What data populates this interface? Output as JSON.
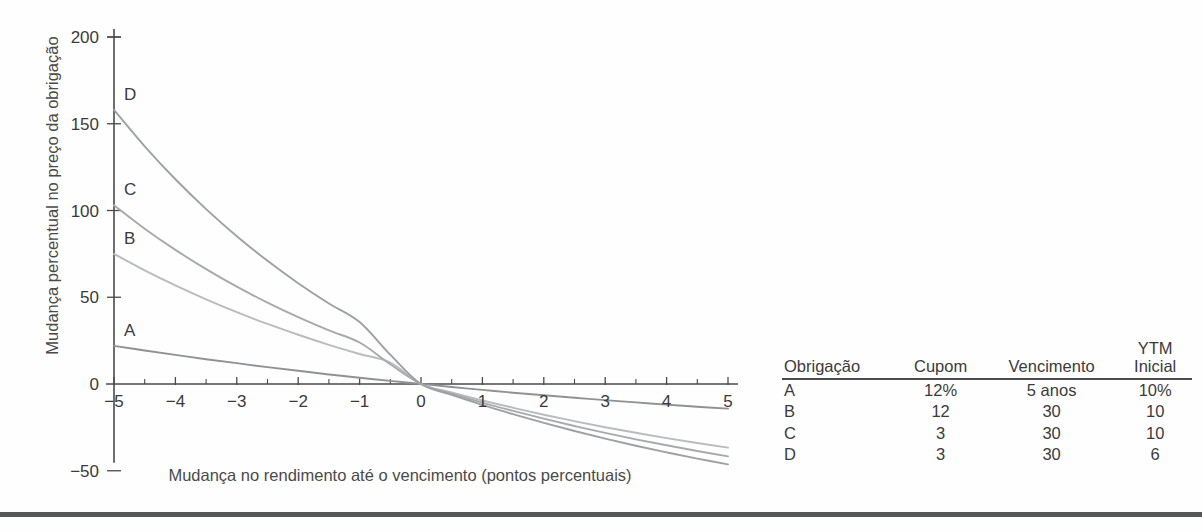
{
  "chart_data": {
    "type": "line",
    "title": "",
    "xlabel": "Mudança no rendimento até o vencimento (pontos percentuais)",
    "ylabel": "Mudança percentual no preço da obrigação",
    "xlim": [
      -5,
      5
    ],
    "ylim": [
      -50,
      200
    ],
    "xticks": [
      -5,
      -4,
      -3,
      -2,
      -1,
      0,
      1,
      2,
      3,
      4,
      5
    ],
    "xtick_labels": [
      "-5",
      "-4",
      "-3",
      "-2",
      "-1",
      "0",
      "1",
      "2",
      "3",
      "4",
      "5"
    ],
    "xtick_minor_step": 0.5,
    "yticks": [
      0,
      50,
      100,
      150,
      200
    ],
    "ytick_labels": [
      "0",
      "50",
      "100",
      "150",
      "200"
    ],
    "grid": false,
    "legend_position": "inline-curve-labels",
    "x": [
      -5,
      -4.5,
      -4,
      -3.5,
      -3,
      -2.5,
      -2,
      -1.5,
      -1,
      -0.5,
      0,
      0.5,
      1,
      1.5,
      2,
      2.5,
      3,
      3.5,
      4,
      4.5,
      5
    ],
    "series": [
      {
        "name": "A",
        "label": "A",
        "color": "#8f9295",
        "values": [
          22.0,
          19.3,
          16.8,
          14.3,
          12.0,
          9.7,
          7.6,
          5.5,
          3.6,
          1.8,
          0.0,
          -1.7,
          -3.4,
          -5.0,
          -6.5,
          -7.9,
          -9.3,
          -10.6,
          -11.9,
          -13.1,
          -14.2
        ]
      },
      {
        "name": "B",
        "label": "B",
        "color": "#b9bcbf",
        "values": [
          75.0,
          65.5,
          56.8,
          48.8,
          41.4,
          34.6,
          28.4,
          22.6,
          17.3,
          12.4,
          0.0,
          -4.9,
          -9.5,
          -13.7,
          -17.7,
          -21.4,
          -24.9,
          -28.1,
          -31.2,
          -34.0,
          -36.7
        ]
      },
      {
        "name": "C",
        "label": "C",
        "color": "#a7aaad",
        "values": [
          103.0,
          89.5,
          77.3,
          66.2,
          56.1,
          46.9,
          38.5,
          30.9,
          23.9,
          11.4,
          0.0,
          -5.5,
          -10.7,
          -15.5,
          -20.0,
          -24.2,
          -28.2,
          -31.9,
          -35.3,
          -38.6,
          -41.7
        ]
      },
      {
        "name": "D",
        "label": "D",
        "color": "#9ea1a4",
        "values": [
          158.0,
          137.0,
          118.0,
          100.8,
          85.2,
          71.0,
          58.1,
          46.4,
          35.7,
          16.9,
          0.0,
          -6.2,
          -12.0,
          -17.4,
          -22.4,
          -27.1,
          -31.5,
          -35.6,
          -39.4,
          -43.0,
          -46.3
        ]
      }
    ]
  },
  "table": {
    "headers": [
      {
        "line1": "Obrigação",
        "line2": ""
      },
      {
        "line1": "Cupom",
        "line2": ""
      },
      {
        "line1": "Vencimento",
        "line2": ""
      },
      {
        "line1": "YTM",
        "line2": "Inicial"
      }
    ],
    "rows": [
      {
        "bond": "A",
        "coupon": "12%",
        "maturity": "5 anos",
        "ytm": "10%"
      },
      {
        "bond": "B",
        "coupon": "12",
        "maturity": "30",
        "ytm": "10"
      },
      {
        "bond": "C",
        "coupon": "3",
        "maturity": "30",
        "ytm": "10"
      },
      {
        "bond": "D",
        "coupon": "3",
        "maturity": "30",
        "ytm": "6"
      }
    ]
  },
  "colors": {
    "axis": "#4a4a4a",
    "text": "#3b3b3b",
    "rule": "#555759"
  }
}
